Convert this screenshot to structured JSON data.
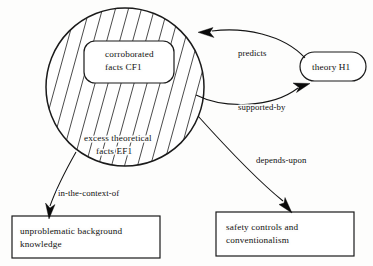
{
  "diagram": {
    "background_color": "#fdfdfc",
    "line_color": "#141414",
    "nodes": {
      "circle_region": {
        "name": "hatched-region",
        "fill_pattern": "diagonal-hatch",
        "inner_label_line1": "excess theoretical",
        "inner_label_line2": "facts EF1"
      },
      "inner_box": {
        "shape": "rounded-rectangle",
        "label_line1": "corroborated",
        "label_line2": "facts CF1"
      },
      "theory": {
        "shape": "stadium",
        "label": "theory H1"
      },
      "background_box": {
        "shape": "rectangle",
        "label_line1": "unproblematic background",
        "label_line2": "knowledge"
      },
      "safety_box": {
        "shape": "rectangle",
        "label_line1": "safety controls and",
        "label_line2": "conventionalism"
      }
    },
    "edges": [
      {
        "id": "predicts",
        "label": "predicts",
        "from": "theory H1",
        "to": "corroborated facts CF1",
        "direction": "left"
      },
      {
        "id": "supported-by",
        "label": "supported-by",
        "from": "corroborated facts CF1",
        "to": "theory H1",
        "direction": "right"
      },
      {
        "id": "in-the-context-of",
        "label": "in-the-context-of",
        "from": "excess theoretical facts EF1",
        "to": "unproblematic background knowledge",
        "direction": "down"
      },
      {
        "id": "depends-upon",
        "label": "depends-upon",
        "from": "excess theoretical facts EF1",
        "to": "safety controls and conventionalism",
        "direction": "down-right"
      }
    ]
  }
}
